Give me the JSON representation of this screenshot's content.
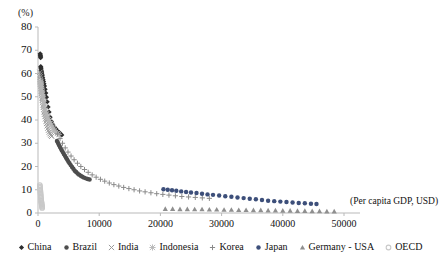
{
  "chart_data": {
    "type": "scatter",
    "title": "",
    "xlabel": "(Per capita GDP, USD)",
    "ylabel": "(%)",
    "xlim": [
      0,
      55000
    ],
    "ylim": [
      0,
      80
    ],
    "xticks": [
      0,
      10000,
      20000,
      30000,
      40000,
      50000
    ],
    "xtick_labels": [
      "0",
      "10000",
      "20000",
      "30000",
      "40000",
      "50000"
    ],
    "yticks": [
      0,
      10,
      20,
      30,
      40,
      50,
      60,
      70,
      80
    ],
    "ytick_labels": [
      "0",
      "10",
      "20",
      "30",
      "40",
      "50",
      "60",
      "70",
      "80"
    ],
    "grid": false,
    "legend_position": "bottom",
    "series": [
      {
        "name": "China",
        "marker": "diamond",
        "color": "#2e2e2e",
        "points": [
          [
            360,
            68.5
          ],
          [
            380,
            68.0
          ],
          [
            400,
            67.6
          ],
          [
            420,
            67.2
          ],
          [
            430,
            66.8
          ],
          [
            450,
            63.0
          ],
          [
            470,
            62.5
          ],
          [
            500,
            62.0
          ],
          [
            540,
            61.4
          ],
          [
            580,
            60.8
          ],
          [
            620,
            60.2
          ],
          [
            660,
            59.6
          ],
          [
            700,
            59.0
          ],
          [
            760,
            58.2
          ],
          [
            820,
            57.4
          ],
          [
            900,
            56.6
          ],
          [
            980,
            55.6
          ],
          [
            1060,
            54.6
          ],
          [
            1160,
            53.2
          ],
          [
            1270,
            51.6
          ],
          [
            1380,
            49.8
          ],
          [
            1500,
            47.8
          ],
          [
            1650,
            45.6
          ],
          [
            1800,
            43.4
          ],
          [
            1980,
            41.2
          ],
          [
            2180,
            39.4
          ],
          [
            2400,
            38.1
          ],
          [
            2650,
            37.0
          ],
          [
            2900,
            36.2
          ],
          [
            3200,
            35.3
          ],
          [
            3520,
            34.5
          ],
          [
            3880,
            33.6
          ]
        ]
      },
      {
        "name": "Brazil",
        "marker": "circle",
        "color": "#4d4d4d",
        "points": [
          [
            3100,
            31.0
          ],
          [
            3250,
            30.2
          ],
          [
            3400,
            29.4
          ],
          [
            3560,
            28.6
          ],
          [
            3720,
            27.8
          ],
          [
            3880,
            27.0
          ],
          [
            4050,
            26.2
          ],
          [
            4220,
            25.4
          ],
          [
            4400,
            24.6
          ],
          [
            4580,
            23.8
          ],
          [
            4760,
            23.0
          ],
          [
            4950,
            22.2
          ],
          [
            5150,
            21.4
          ],
          [
            5350,
            20.6
          ],
          [
            5560,
            19.8
          ],
          [
            5780,
            19.0
          ],
          [
            6000,
            18.2
          ],
          [
            6230,
            17.6
          ],
          [
            6470,
            17.0
          ],
          [
            6720,
            16.5
          ],
          [
            6980,
            16.0
          ],
          [
            7250,
            15.6
          ],
          [
            7530,
            15.2
          ],
          [
            7820,
            14.9
          ],
          [
            8120,
            14.6
          ],
          [
            8430,
            14.4
          ]
        ]
      },
      {
        "name": "India",
        "marker": "x",
        "color": "#9a9a9a",
        "points": [
          [
            320,
            60.5
          ],
          [
            345,
            59.5
          ],
          [
            370,
            58.5
          ],
          [
            395,
            57.5
          ],
          [
            420,
            56.5
          ],
          [
            450,
            55.5
          ],
          [
            480,
            54.5
          ],
          [
            515,
            53.5
          ],
          [
            550,
            52.5
          ],
          [
            590,
            51.5
          ],
          [
            630,
            50.5
          ],
          [
            675,
            49.5
          ],
          [
            720,
            48.5
          ],
          [
            770,
            47.5
          ],
          [
            825,
            46.5
          ],
          [
            880,
            45.5
          ],
          [
            940,
            44.5
          ],
          [
            1005,
            43.5
          ],
          [
            1075,
            42.5
          ],
          [
            1150,
            41.5
          ],
          [
            1230,
            40.5
          ],
          [
            1315,
            39.5
          ],
          [
            1405,
            38.5
          ],
          [
            1500,
            37.5
          ],
          [
            1605,
            36.5
          ],
          [
            1715,
            35.6
          ],
          [
            1835,
            34.8
          ],
          [
            1960,
            34.1
          ],
          [
            2095,
            33.5
          ],
          [
            2240,
            33.0
          ]
        ]
      },
      {
        "name": "Indonesia",
        "marker": "star",
        "color": "#b5b5b5",
        "points": [
          [
            380,
            56.8
          ],
          [
            410,
            56.2
          ],
          [
            440,
            55.6
          ],
          [
            475,
            55.0
          ],
          [
            510,
            54.4
          ],
          [
            550,
            53.6
          ],
          [
            595,
            52.8
          ],
          [
            640,
            52.0
          ],
          [
            690,
            51.0
          ],
          [
            745,
            50.0
          ],
          [
            805,
            49.0
          ],
          [
            870,
            48.0
          ],
          [
            940,
            47.0
          ],
          [
            1015,
            46.0
          ],
          [
            1095,
            45.0
          ],
          [
            1180,
            44.2
          ],
          [
            1275,
            43.4
          ],
          [
            1375,
            42.6
          ],
          [
            1485,
            41.8
          ],
          [
            1600,
            41.0
          ],
          [
            1730,
            40.2
          ],
          [
            1865,
            39.4
          ],
          [
            2010,
            38.6
          ],
          [
            2170,
            37.8
          ],
          [
            2340,
            37.0
          ],
          [
            2520,
            36.2
          ],
          [
            2720,
            35.4
          ],
          [
            2930,
            34.8
          ],
          [
            3160,
            34.2
          ],
          [
            3400,
            33.8
          ]
        ]
      },
      {
        "name": "Korea",
        "marker": "plus",
        "color": "#8a8a8a",
        "points": [
          [
            3200,
            34.0
          ],
          [
            3600,
            32.0
          ],
          [
            4000,
            30.0
          ],
          [
            4450,
            28.0
          ],
          [
            4900,
            26.2
          ],
          [
            5400,
            24.5
          ],
          [
            5900,
            22.9
          ],
          [
            6450,
            21.4
          ],
          [
            7000,
            20.0
          ],
          [
            7600,
            18.7
          ],
          [
            8200,
            17.5
          ],
          [
            8850,
            16.4
          ],
          [
            9500,
            15.4
          ],
          [
            10200,
            14.5
          ],
          [
            10900,
            13.7
          ],
          [
            11650,
            12.9
          ],
          [
            12400,
            12.2
          ],
          [
            13200,
            11.6
          ],
          [
            14000,
            11.0
          ],
          [
            14850,
            10.5
          ],
          [
            15700,
            10.0
          ],
          [
            16600,
            9.5
          ],
          [
            17500,
            9.1
          ],
          [
            18450,
            8.7
          ],
          [
            19400,
            8.3
          ],
          [
            20400,
            8.0
          ],
          [
            21400,
            7.7
          ],
          [
            22450,
            7.4
          ],
          [
            23500,
            7.1
          ],
          [
            24600,
            6.9
          ],
          [
            25700,
            6.7
          ],
          [
            26850,
            6.5
          ],
          [
            28000,
            6.3
          ]
        ]
      },
      {
        "name": "Japan",
        "marker": "circle",
        "color": "#3d4f7a",
        "points": [
          [
            20500,
            10.2
          ],
          [
            21200,
            10.0
          ],
          [
            21900,
            9.8
          ],
          [
            22600,
            9.6
          ],
          [
            23400,
            9.3
          ],
          [
            24200,
            9.0
          ],
          [
            25000,
            8.8
          ],
          [
            25900,
            8.6
          ],
          [
            26800,
            8.3
          ],
          [
            27700,
            8.0
          ],
          [
            28600,
            7.8
          ],
          [
            29600,
            7.5
          ],
          [
            30600,
            7.2
          ],
          [
            31600,
            7.0
          ],
          [
            32600,
            6.7
          ],
          [
            33600,
            6.4
          ],
          [
            34600,
            6.1
          ],
          [
            35600,
            5.9
          ],
          [
            36600,
            5.6
          ],
          [
            37600,
            5.3
          ],
          [
            38600,
            5.1
          ],
          [
            39600,
            4.9
          ],
          [
            40600,
            4.7
          ],
          [
            41600,
            4.5
          ],
          [
            42600,
            4.3
          ],
          [
            43600,
            4.2
          ],
          [
            44600,
            4.0
          ],
          [
            45500,
            3.9
          ]
        ]
      },
      {
        "name": "Germany - USA",
        "marker": "triangle",
        "color": "#8f8f8f",
        "points": [
          [
            20800,
            1.8
          ],
          [
            22000,
            1.8
          ],
          [
            23200,
            1.7
          ],
          [
            24400,
            1.7
          ],
          [
            25600,
            1.6
          ],
          [
            26800,
            1.6
          ],
          [
            28000,
            1.5
          ],
          [
            29200,
            1.5
          ],
          [
            30400,
            1.4
          ],
          [
            31600,
            1.4
          ],
          [
            32800,
            1.3
          ],
          [
            34000,
            1.3
          ],
          [
            35200,
            1.2
          ],
          [
            36400,
            1.2
          ],
          [
            37600,
            1.1
          ],
          [
            38800,
            1.1
          ],
          [
            40000,
            1.0
          ],
          [
            41200,
            1.0
          ],
          [
            42400,
            0.9
          ],
          [
            43600,
            0.9
          ],
          [
            44800,
            0.8
          ],
          [
            46000,
            0.8
          ],
          [
            47200,
            0.7
          ],
          [
            48400,
            0.7
          ]
        ]
      },
      {
        "name": "OECD",
        "marker": "circle-open",
        "color": "#c9c9c9",
        "points": [
          [
            300,
            12.0
          ],
          [
            320,
            11.4
          ],
          [
            340,
            10.8
          ],
          [
            360,
            10.2
          ],
          [
            380,
            9.6
          ],
          [
            400,
            9.0
          ],
          [
            420,
            8.4
          ],
          [
            440,
            7.8
          ],
          [
            460,
            7.2
          ],
          [
            480,
            6.6
          ],
          [
            500,
            6.0
          ],
          [
            520,
            5.4
          ],
          [
            540,
            5.0
          ],
          [
            560,
            4.6
          ],
          [
            580,
            4.2
          ],
          [
            600,
            3.8
          ],
          [
            620,
            3.4
          ],
          [
            640,
            3.0
          ],
          [
            660,
            2.6
          ],
          [
            680,
            2.2
          ]
        ]
      }
    ]
  },
  "legend": {
    "items": [
      {
        "label": "China",
        "marker": "diamond",
        "color": "#2e2e2e"
      },
      {
        "label": "Brazil",
        "marker": "circle",
        "color": "#4d4d4d"
      },
      {
        "label": "India",
        "marker": "x",
        "color": "#9a9a9a"
      },
      {
        "label": "Indonesia",
        "marker": "star",
        "color": "#b5b5b5"
      },
      {
        "label": "Korea",
        "marker": "plus",
        "color": "#8a8a8a"
      },
      {
        "label": "Japan",
        "marker": "circle",
        "color": "#3d4f7a"
      },
      {
        "label": "Germany - USA",
        "marker": "triangle",
        "color": "#8f8f8f"
      },
      {
        "label": "OECD",
        "marker": "circle-open",
        "color": "#c9c9c9"
      }
    ]
  }
}
